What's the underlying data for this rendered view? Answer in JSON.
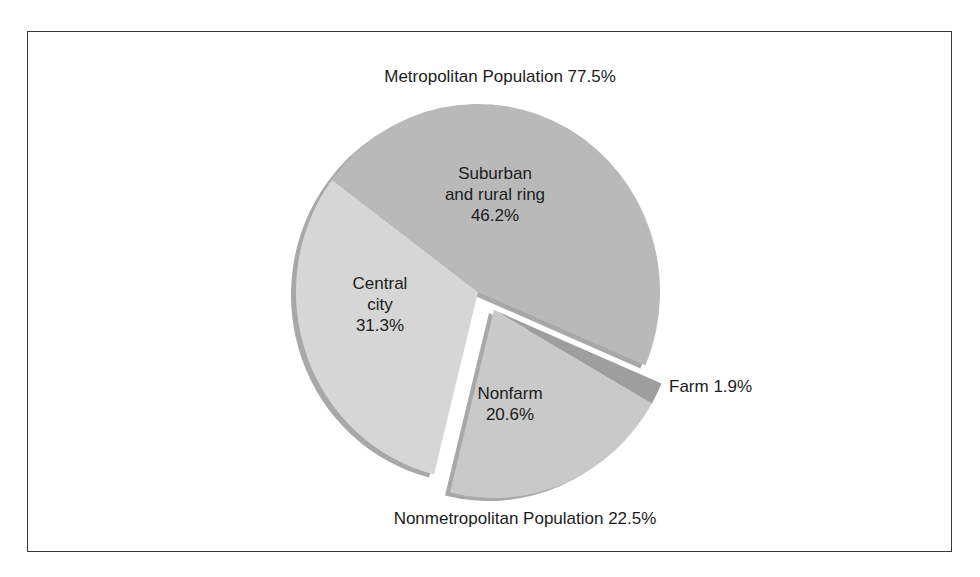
{
  "chart_data": {
    "type": "pie",
    "title": "",
    "groups": [
      {
        "name": "Metropolitan Population",
        "value": 77.5,
        "label": "Metropolitan Population 77.5%"
      },
      {
        "name": "Nonmetropolitan Population",
        "value": 22.5,
        "label": "Nonmetropolitan Population 22.5%",
        "exploded": true
      }
    ],
    "slices": [
      {
        "name": "Suburban and rural ring",
        "value": 46.2,
        "group": "Metropolitan Population",
        "label_lines": [
          "Suburban",
          "and rural ring",
          "46.2%"
        ],
        "color": "#b9b9b9"
      },
      {
        "name": "Central city",
        "value": 31.3,
        "group": "Metropolitan Population",
        "label_lines": [
          "Central",
          "city",
          "31.3%"
        ],
        "color": "#d6d6d6"
      },
      {
        "name": "Nonfarm",
        "value": 20.6,
        "group": "Nonmetropolitan Population",
        "label_lines": [
          "Nonfarm",
          "20.6%"
        ],
        "color": "#c9c9c9"
      },
      {
        "name": "Farm",
        "value": 1.9,
        "group": "Nonmetropolitan Population",
        "label_lines": [
          "Farm 1.9%"
        ],
        "color": "#9e9e9e"
      }
    ],
    "legend": "none",
    "grid": false
  },
  "labels": {
    "metro_title": "Metropolitan Population 77.5%",
    "nonmetro_title": "Nonmetropolitan Population 22.5%",
    "suburban_l1": "Suburban",
    "suburban_l2": "and rural ring",
    "suburban_l3": "46.2%",
    "central_l1": "Central",
    "central_l2": "city",
    "central_l3": "31.3%",
    "nonfarm_l1": "Nonfarm",
    "nonfarm_l2": "20.6%",
    "farm_l1": "Farm 1.9%"
  }
}
